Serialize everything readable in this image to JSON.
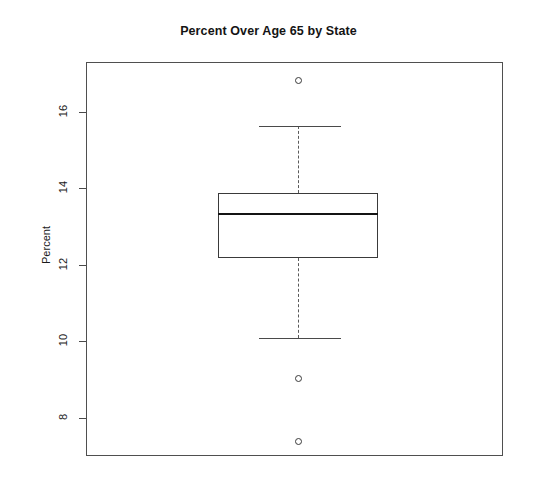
{
  "chart_data": {
    "type": "box",
    "title": "Percent Over Age 65 by State",
    "xlabel": "",
    "ylabel": "Percent",
    "ylim": [
      7.0,
      17.3
    ],
    "grid": false,
    "legend": null,
    "yticks": [
      8,
      10,
      12,
      14,
      16
    ],
    "ytick_labels": [
      "8",
      "10",
      "12",
      "14",
      "16"
    ],
    "categories": [
      "Percent Over Age 65"
    ],
    "boxes": [
      {
        "name": "Percent Over Age 65 by State",
        "min_whisker": 10.1,
        "q1": 12.2,
        "median": 13.35,
        "q3": 13.9,
        "max_whisker": 15.65,
        "outliers": [
          16.85,
          9.05,
          7.4
        ]
      }
    ]
  },
  "axis": {
    "y_label": "Percent",
    "ticks": [
      {
        "label": "16",
        "value": 16
      },
      {
        "label": "14",
        "value": 14
      },
      {
        "label": "12",
        "value": 12
      },
      {
        "label": "10",
        "value": 10
      },
      {
        "label": "8",
        "value": 8
      }
    ]
  },
  "title": "Percent Over Age 65 by State"
}
